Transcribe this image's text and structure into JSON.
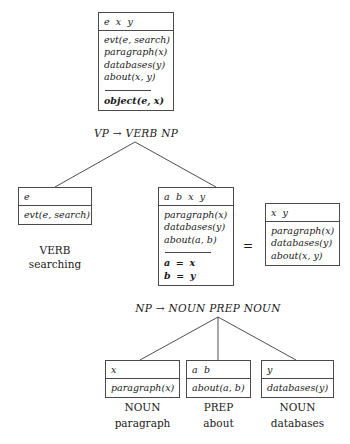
{
  "figure": {
    "nodes": {
      "vp": {
        "header": "e x y",
        "conditions": [
          "evt(e, search)",
          "paragraph(x)",
          "databases(y)",
          "about(x, y)"
        ],
        "derived": [
          "object(e, x)"
        ],
        "rule": "VP → VERB NP"
      },
      "verb": {
        "header": "e",
        "conditions": [
          "evt(e, search)"
        ],
        "category": "VERB",
        "word": "searching"
      },
      "np": {
        "header": "a b x y",
        "conditions": [
          "paragraph(x)",
          "databases(y)",
          "about(a, b)"
        ],
        "derived": [
          "a = x",
          "b = y"
        ],
        "rule": "NP → NOUN PREP NOUN"
      },
      "np_reduced": {
        "header": "x y",
        "conditions": [
          "paragraph(x)",
          "databases(y)",
          "about(x, y)"
        ]
      },
      "noun_left": {
        "header": "x",
        "conditions": [
          "paragraph(x)"
        ],
        "category": "NOUN",
        "word": "paragraph"
      },
      "prep": {
        "header": "a b",
        "conditions": [
          "about(a, b)"
        ],
        "category": "PREP",
        "word": "about"
      },
      "noun_right": {
        "header": "y",
        "conditions": [
          "databases(y)"
        ],
        "category": "NOUN",
        "word": "databases"
      }
    },
    "equals_sign": "=",
    "colors": {
      "ink": "#1a1a1a",
      "rule": "#4a4a4a",
      "background": "#ffffff"
    }
  }
}
